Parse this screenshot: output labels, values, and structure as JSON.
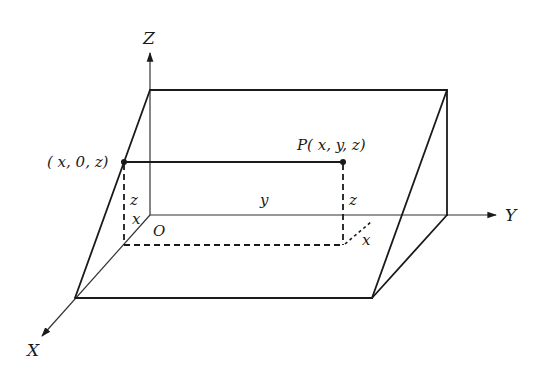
{
  "diagram": {
    "type": "3d-coordinate-geometry",
    "axes": {
      "x_label": "X",
      "y_label": "Y",
      "z_label": "Z",
      "origin_label": "O"
    },
    "points": {
      "p_label": "P( x, y, z)",
      "xz_projection_label": "( x, 0, z)"
    },
    "segment_labels": {
      "left_z": "z",
      "left_x": "x",
      "middle_y": "y",
      "right_z": "z",
      "right_x": "x"
    },
    "colors": {
      "ink": "#1a1a1a",
      "axis": "#333333",
      "background": "#ffffff"
    }
  }
}
